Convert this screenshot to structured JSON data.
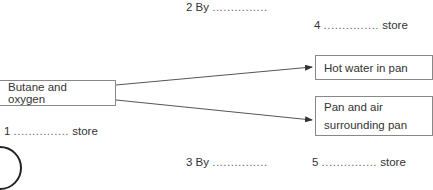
{
  "diagram": {
    "source": {
      "label": "Butane and oxygen"
    },
    "targets": [
      {
        "label": "Hot water in pan"
      },
      {
        "label_line1": "Pan and air",
        "label_line2": "surrounding pan"
      }
    ],
    "blanks": {
      "b1": {
        "number": "1",
        "dots": "...............",
        "suffix": "store"
      },
      "b2": {
        "number": "2 By",
        "dots": "..............."
      },
      "b3": {
        "number": "3 By",
        "dots": "..............."
      },
      "b4": {
        "number": "4",
        "dots": "...............",
        "suffix": "store"
      },
      "b5": {
        "number": "5",
        "dots": "...............",
        "suffix": "store"
      }
    },
    "colors": {
      "line": "#555555",
      "box_border": "#888888",
      "text": "#333333"
    }
  }
}
